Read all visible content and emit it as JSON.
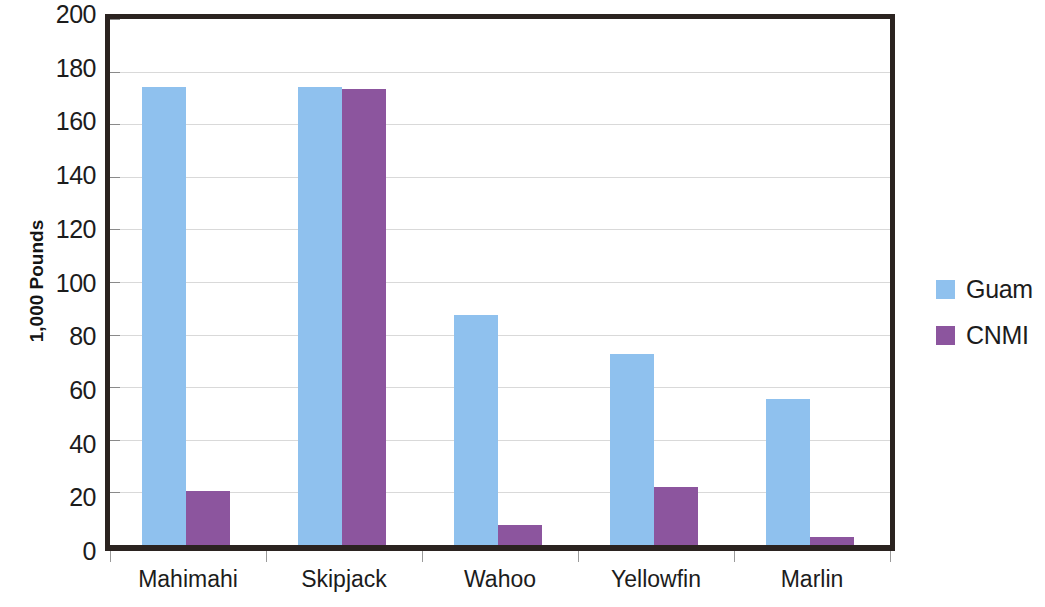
{
  "chart_data": {
    "type": "bar",
    "title": "",
    "xlabel": "",
    "ylabel": "1,000 Pounds",
    "categories": [
      "Mahimahi",
      "Skipjack",
      "Wahoo",
      "Yellowfin",
      "Marlin"
    ],
    "series": [
      {
        "name": "Guam",
        "color": "#8fc1ee",
        "values": [
          174,
          174,
          87.5,
          72.5,
          55.5
        ]
      },
      {
        "name": "CNMI",
        "color": "#8c559e",
        "values": [
          20.5,
          173.5,
          7.5,
          22,
          3
        ]
      }
    ],
    "ylim": [
      0,
      200
    ],
    "ytick_step": 20,
    "ytick_labels": [
      "0",
      "20",
      "40",
      "60",
      "80",
      "100",
      "120",
      "140",
      "160",
      "180",
      "200"
    ],
    "grid": true,
    "legend_position": "right",
    "legend_entries": [
      "Guam",
      "CNMI"
    ]
  },
  "axis": {
    "y_title": "1,000 Pounds"
  },
  "legend": {
    "items": [
      {
        "label": "Guam"
      },
      {
        "label": "CNMI"
      }
    ]
  }
}
